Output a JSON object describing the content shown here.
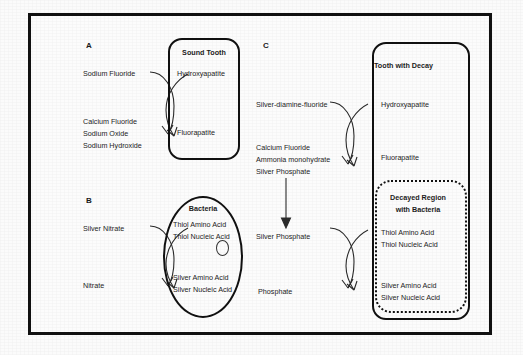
{
  "figure": {
    "background_color": "#fbfbfb",
    "border_color": "#111111",
    "text_color": "#1c1c1c"
  },
  "panels": {
    "a": {
      "label": "A",
      "reactants": [
        "Sodium Fluoride"
      ],
      "products": [
        "Calcium Fluoride",
        "Sodium Oxide",
        "Sodium Hydroxide"
      ],
      "box_title": "Sound Tooth",
      "box_upper": "Hydroxyapatite",
      "box_lower": "Fluorapatite"
    },
    "b": {
      "label": "B",
      "reactants": [
        "Silver Nitrate"
      ],
      "products": [
        "Nitrate"
      ],
      "oval_title": "Bacteria",
      "oval_upper": [
        "Thiol Amino Acid",
        "Thiol Nucleic Acid"
      ],
      "oval_lower": [
        "Silver Amino Acid",
        "Silver Nucleic Acid"
      ]
    },
    "c": {
      "label": "C",
      "reactants": [
        "Silver-diamine-fluoride"
      ],
      "products": [
        "Calcium Fluoride",
        "Ammonia monohydrate",
        "Silver Phosphate"
      ],
      "intermediate": "Silver Phosphate",
      "final_product": "Phosphate",
      "box_title": "Tooth with Decay",
      "box_upper": "Hydroxyapatite",
      "box_lower": "Fluorapatite",
      "decay_title_line1": "Decayed Region",
      "decay_title_line2": "with Bacteria",
      "decay_upper": [
        "Thiol Amino Acid",
        "Thiol Nucleic Acid"
      ],
      "decay_lower": [
        "Silver Amino Acid",
        "Silver Nucleic Acid"
      ]
    }
  }
}
